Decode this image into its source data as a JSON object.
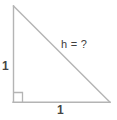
{
  "figure": {
    "background_color": "#ffffff",
    "stroke_color": "#b4b4b4",
    "text_color": "#454545",
    "labels": {
      "vertical_leg": "1",
      "horizontal_leg": "1",
      "hypotenuse": "h = ?"
    },
    "geometry": {
      "apex_top": "13,6",
      "corner_right_angle": "13,102",
      "vertex_right": "110,102",
      "right_angle_marker_size": "9"
    }
  }
}
